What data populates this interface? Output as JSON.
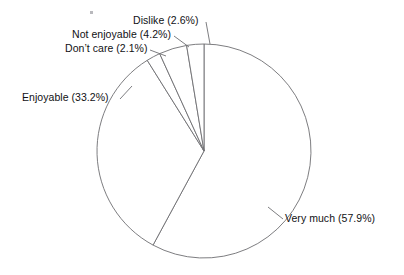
{
  "chart_data": {
    "type": "pie",
    "title": "",
    "subtitle": "",
    "xlabel": "",
    "ylabel": "",
    "legend_position": "none",
    "grid": false,
    "start_angle_deg": 0,
    "direction": "clockwise",
    "categories": [
      "Very much",
      "Enjoyable",
      "Don't care",
      "Not enjoyable",
      "Dislike"
    ],
    "values": [
      57.9,
      33.2,
      2.1,
      4.2,
      2.6
    ],
    "value_unit": "%",
    "slices": [
      {
        "name": "Very much",
        "value": 57.9,
        "label": "Very much (57.9%)"
      },
      {
        "name": "Enjoyable",
        "value": 33.2,
        "label": "Enjoyable (33.2%)"
      },
      {
        "name": "Don't care",
        "value": 2.1,
        "label": "Don’t care (2.1%)"
      },
      {
        "name": "Not enjoyable",
        "value": 4.2,
        "label": "Not enjoyable (4.2%)"
      },
      {
        "name": "Dislike",
        "value": 2.6,
        "label": "Dislike (2.6%)"
      }
    ],
    "labels": {
      "very_much": "Very much (57.9%)",
      "enjoyable": "Enjoyable (33.2%)",
      "dont_care": "Don’t care (2.1%)",
      "not_enjoyable": "Not enjoyable (4.2%)",
      "dislike": "Dislike (2.6%)"
    },
    "style": {
      "background": "#ffffff",
      "stroke": "#6e6e72",
      "fill": "#ffffff",
      "text": "#111114"
    },
    "geometry": {
      "center_x": 204,
      "center_y": 151,
      "radius": 107
    }
  }
}
